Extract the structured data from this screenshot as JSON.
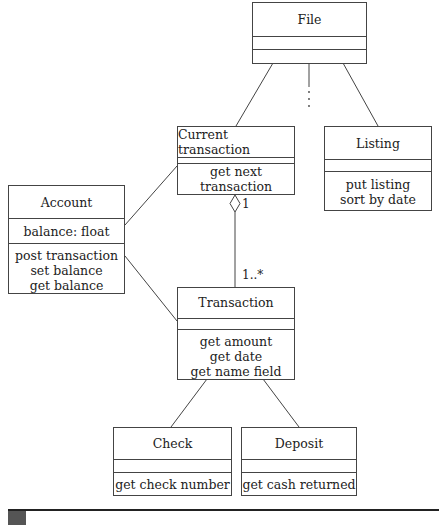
{
  "diagram": {
    "type": "uml-class-diagram",
    "classes": [
      {
        "id": "file",
        "name": "File",
        "attributes": [],
        "operations": []
      },
      {
        "id": "current",
        "name": "Current transaction",
        "attributes": [],
        "operations": [
          "get next transaction"
        ]
      },
      {
        "id": "listing",
        "name": "Listing",
        "attributes": [],
        "operations": [
          "put listing",
          "sort by date"
        ]
      },
      {
        "id": "account",
        "name": "Account",
        "attributes": [
          "balance: float"
        ],
        "operations": [
          "post transaction",
          "set balance",
          "get balance"
        ]
      },
      {
        "id": "transaction",
        "name": "Transaction",
        "attributes": [],
        "operations": [
          "get amount",
          "get date",
          "get name field"
        ]
      },
      {
        "id": "check",
        "name": "Check",
        "attributes": [],
        "operations": [
          "get check number"
        ]
      },
      {
        "id": "deposit",
        "name": "Deposit",
        "attributes": [],
        "operations": [
          "get cash returned"
        ]
      }
    ],
    "relationships": [
      {
        "from": "file",
        "to": "current",
        "kind": "association"
      },
      {
        "from": "file",
        "to": "listing",
        "kind": "association"
      },
      {
        "from": "file",
        "to": "more",
        "kind": "ellipsis",
        "label": "⋮"
      },
      {
        "from": "current",
        "to": "transaction",
        "kind": "aggregation",
        "from_mult": "1",
        "to_mult": "1..*"
      },
      {
        "from": "account",
        "to": "current",
        "kind": "association"
      },
      {
        "from": "account",
        "to": "transaction",
        "kind": "association"
      },
      {
        "from": "transaction",
        "to": "check",
        "kind": "association"
      },
      {
        "from": "transaction",
        "to": "deposit",
        "kind": "association"
      }
    ],
    "labels": {
      "agg_mult_1": "1",
      "agg_mult_many": "1..*"
    }
  }
}
